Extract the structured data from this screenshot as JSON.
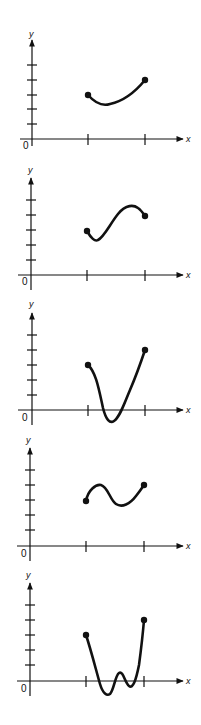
{
  "axis_labels": {
    "x": "x",
    "y": "y",
    "origin": "0"
  },
  "colors": {
    "ink": "#111111",
    "background": "#ffffff"
  },
  "panels": [
    {
      "id": 1,
      "description": "curve dips slightly then rises to higher endpoint",
      "start_point": [
        1,
        3
      ],
      "end_point": [
        2,
        4
      ],
      "min_below_axis": false
    },
    {
      "id": 2,
      "description": "curve dips, rises to local max, then falls slightly to endpoint",
      "start_point": [
        1,
        3
      ],
      "end_point": [
        2,
        4
      ],
      "min_below_axis": false
    },
    {
      "id": 3,
      "description": "curve drops below x-axis then rises steeply to higher endpoint",
      "start_point": [
        1,
        3
      ],
      "end_point": [
        2,
        4
      ],
      "min_below_axis": true
    },
    {
      "id": 4,
      "description": "curve rises to local max, dips to local min, rises to endpoint",
      "start_point": [
        1,
        3
      ],
      "end_point": [
        2,
        4
      ],
      "min_below_axis": false
    },
    {
      "id": 5,
      "description": "W-shaped curve crossing x-axis several times, ends at higher endpoint",
      "start_point": [
        1,
        3
      ],
      "end_point": [
        2,
        4
      ],
      "min_below_axis": true
    }
  ]
}
